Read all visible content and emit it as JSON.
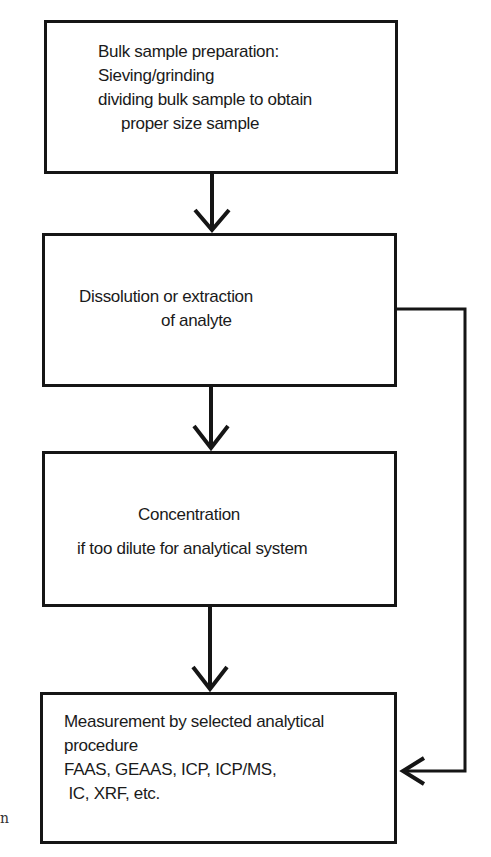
{
  "diagram": {
    "type": "flowchart",
    "boxes": [
      {
        "id": "bulk-sample-preparation",
        "lines": [
          "Bulk sample preparation:",
          "Sieving/grinding",
          "dividing bulk sample to obtain",
          "proper size sample"
        ]
      },
      {
        "id": "dissolution",
        "lines": [
          "Dissolution or  extraction",
          "of analyte"
        ]
      },
      {
        "id": "concentration",
        "lines": [
          "Concentration",
          "if too dilute for analytical system"
        ]
      },
      {
        "id": "measurement",
        "lines": [
          "Measurement by selected analytical",
          "procedure",
          "FAAS, GEAAS,  ICP, ICP/MS,",
          " IC, XRF, etc."
        ]
      }
    ],
    "edges": [
      {
        "from": "bulk-sample-preparation",
        "to": "dissolution"
      },
      {
        "from": "dissolution",
        "to": "concentration"
      },
      {
        "from": "concentration",
        "to": "measurement"
      },
      {
        "from": "dissolution",
        "to": "measurement",
        "route": "bypass-right"
      }
    ],
    "margin_text": "n"
  }
}
